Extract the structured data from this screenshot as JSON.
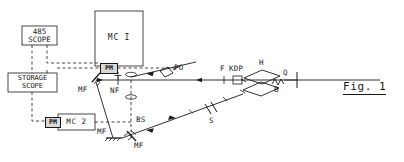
{
  "figure": {
    "caption": "Fig. 1",
    "kind": "optical-laser-setup-schematic"
  },
  "instruments": [
    {
      "id": "scope-485",
      "name": "485 SCOPE",
      "lines": [
        "485",
        "SCOPE"
      ],
      "x": 22,
      "y": 26,
      "w": 35,
      "h": 19,
      "font_size": 7.5
    },
    {
      "id": "storage-scope",
      "name": "STORAGE SCOPE",
      "lines": [
        "STORAGE",
        "SCOPE"
      ],
      "x": 8,
      "y": 73,
      "w": 49,
      "h": 19,
      "font_size": 7.0
    },
    {
      "id": "mc-1",
      "name": "MC I",
      "lines": [
        "MC I"
      ],
      "x": 95,
      "y": 11,
      "w": 48,
      "h": 55,
      "font_size": 8.0
    },
    {
      "id": "mc-2",
      "name": "MC 2",
      "lines": [
        "MC 2"
      ],
      "x": 58,
      "y": 114,
      "w": 37,
      "h": 16,
      "font_size": 7.5
    }
  ],
  "photomultipliers": [
    {
      "id": "pm-mc1",
      "label": "PM",
      "x": 100,
      "y": 63,
      "w": 16,
      "h": 9
    },
    {
      "id": "pm-mc2",
      "label": "PM",
      "x": 45,
      "y": 117,
      "w": 14,
      "h": 9
    }
  ],
  "component_labels": [
    {
      "id": "mf-upper",
      "text": "MF",
      "x": 78,
      "y": 86,
      "font_size": 7.5
    },
    {
      "id": "nf",
      "text": "NF",
      "x": 110,
      "y": 87,
      "font_size": 7.5
    },
    {
      "id": "po",
      "text": "PO",
      "x": 170,
      "y": 67,
      "font_size": 7.5
    },
    {
      "id": "bs",
      "text": "BS",
      "x": 135,
      "y": 117,
      "font_size": 7.5
    },
    {
      "id": "mf-lower-left",
      "text": "MF",
      "x": 97,
      "y": 131,
      "font_size": 7.5
    },
    {
      "id": "mf-lower-right",
      "text": "MF",
      "x": 133,
      "y": 144,
      "font_size": 7.5
    },
    {
      "id": "s",
      "text": "S",
      "x": 211,
      "y": 118,
      "font_size": 7.5
    },
    {
      "id": "f",
      "text": "F",
      "x": 221,
      "y": 68,
      "font_size": 7.5
    },
    {
      "id": "kdp",
      "text": "KDP",
      "x": 230,
      "y": 68,
      "font_size": 7.5
    },
    {
      "id": "h",
      "text": "H",
      "x": 259,
      "y": 62,
      "font_size": 7.5
    },
    {
      "id": "q",
      "text": "Q",
      "x": 283,
      "y": 76,
      "font_size": 7.5
    },
    {
      "id": "b",
      "text": "B",
      "x": 275,
      "y": 92,
      "font_size": 7.5
    }
  ],
  "colors": {
    "ink": "#1a1a1a",
    "paper": "#ffffff",
    "chip_fill": "#d9d9d9"
  },
  "legend_notes": {
    "solid_lines": "optical beam path",
    "dashed_lines": "electrical signal cable"
  }
}
